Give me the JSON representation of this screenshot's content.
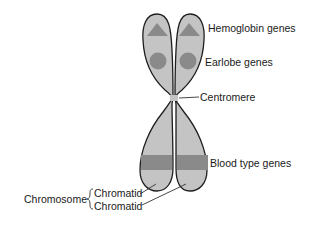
{
  "diagram": {
    "labels": {
      "hemoglobin": "Hemoglobin genes",
      "earlobe": "Earlobe genes",
      "centromere": "Centromere",
      "blood_type": "Blood type genes",
      "chromosome": "Chromosome",
      "chromatid_1": "Chromatid",
      "chromatid_2": "Chromatid"
    },
    "colors": {
      "chromatid_fill": "#c4c4c4",
      "outline": "#1e1e1e",
      "gene_marker": "#8a8a8a",
      "text": "#1a1a1a"
    },
    "gene_markers": [
      {
        "gene": "hemoglobin",
        "shape": "triangle"
      },
      {
        "gene": "earlobe",
        "shape": "circle"
      },
      {
        "gene": "blood_type",
        "shape": "rectangle"
      }
    ]
  }
}
